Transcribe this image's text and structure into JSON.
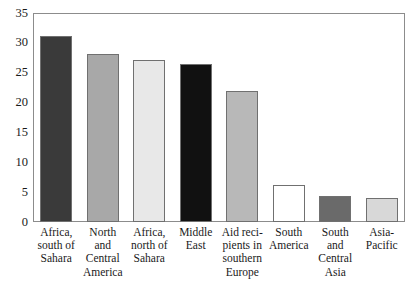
{
  "chart_data": {
    "type": "bar",
    "title": "",
    "subtitle": "",
    "xlabel": "",
    "ylabel": "",
    "ylim": [
      0,
      35
    ],
    "ytick_values": [
      0,
      5,
      10,
      15,
      20,
      25,
      30,
      35
    ],
    "ytick_labels": [
      "0",
      "5",
      "10",
      "15",
      "20",
      "25",
      "30",
      "35"
    ],
    "grid": false,
    "legend": "none",
    "categories": [
      "Africa,\nsouth of\nSahara",
      "North\nand\nCentral\nAmerica",
      "Africa,\nnorth of\nSahara",
      "Middle\nEast",
      "Aid reci-\npients in\nsouthern\nEurope",
      "South\nAmerica",
      "South\nand\nCentral\nAsia",
      "Asia-\nPacific"
    ],
    "categories_plain": [
      "Africa, south of Sahara",
      "North and Central America",
      "Africa, north of Sahara",
      "Middle East",
      "Aid recipients in southern Europe",
      "South America",
      "South and Central Asia",
      "Asia-Pacific"
    ],
    "values": [
      31.2,
      28.2,
      27.2,
      26.5,
      22.0,
      6.2,
      4.3,
      4.1
    ],
    "bar_colors": [
      "#3a3a3a",
      "#a8a8a8",
      "#e8e8e8",
      "#111111",
      "#b8b8b8",
      "#ffffff",
      "#6a6a6a",
      "#d8d8d8"
    ],
    "bar_edge_color": "#707070",
    "axis_color": "#8c8c8c",
    "background_color": "#ffffff",
    "text_color": "#1a1a1a"
  }
}
